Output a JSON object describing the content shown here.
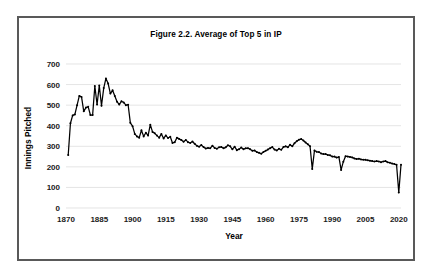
{
  "figure": {
    "title": "Figure 2.2. Average of Top 5 in IP",
    "border_color": "#595959",
    "background": "#ffffff"
  },
  "axis": {
    "x_label": "Year",
    "y_label": "Innings Pitched",
    "x_ticks": [
      "1870",
      "1885",
      "1900",
      "1915",
      "1930",
      "1945",
      "1960",
      "1975",
      "1990",
      "2005",
      "2020"
    ],
    "y_ticks": [
      "0",
      "100",
      "200",
      "300",
      "400",
      "500",
      "600",
      "700"
    ]
  },
  "chart_data": {
    "type": "line",
    "title": "Figure 2.2. Average of Top 5 in IP",
    "xlabel": "Year",
    "ylabel": "Innings Pitched",
    "xlim": [
      1870,
      2021
    ],
    "ylim": [
      0,
      700
    ],
    "grid": "horizontal",
    "legend": "none",
    "marker": "filled-circle",
    "line_color": "#000000",
    "x_tick_step": 15,
    "y_tick_step": 100,
    "annotations": [
      {
        "x": 1884,
        "y": 630,
        "note": "peak of series"
      },
      {
        "x": 1981,
        "y": 190,
        "note": "strike-shortened season"
      },
      {
        "x": 1994,
        "y": 185,
        "note": "strike-shortened season"
      },
      {
        "x": 2020,
        "y": 75,
        "note": "shortened season"
      }
    ],
    "x": [
      1871,
      1872,
      1873,
      1874,
      1875,
      1876,
      1877,
      1878,
      1879,
      1880,
      1881,
      1882,
      1883,
      1884,
      1885,
      1886,
      1887,
      1888,
      1889,
      1890,
      1891,
      1892,
      1893,
      1894,
      1895,
      1896,
      1897,
      1898,
      1899,
      1900,
      1901,
      1902,
      1903,
      1904,
      1905,
      1906,
      1907,
      1908,
      1909,
      1910,
      1911,
      1912,
      1913,
      1914,
      1915,
      1916,
      1917,
      1918,
      1919,
      1920,
      1921,
      1922,
      1923,
      1924,
      1925,
      1926,
      1927,
      1928,
      1929,
      1930,
      1931,
      1932,
      1933,
      1934,
      1935,
      1936,
      1937,
      1938,
      1939,
      1940,
      1941,
      1942,
      1943,
      1944,
      1945,
      1946,
      1947,
      1948,
      1949,
      1950,
      1951,
      1952,
      1953,
      1954,
      1955,
      1956,
      1957,
      1958,
      1959,
      1960,
      1961,
      1962,
      1963,
      1964,
      1965,
      1966,
      1967,
      1968,
      1969,
      1970,
      1971,
      1972,
      1973,
      1974,
      1975,
      1976,
      1977,
      1978,
      1979,
      1980,
      1981,
      1982,
      1983,
      1984,
      1985,
      1986,
      1987,
      1988,
      1989,
      1990,
      1991,
      1992,
      1993,
      1994,
      1995,
      1996,
      1997,
      1998,
      1999,
      2000,
      2001,
      2002,
      2003,
      2004,
      2005,
      2006,
      2007,
      2008,
      2009,
      2010,
      2011,
      2012,
      2013,
      2014,
      2015,
      2016,
      2017,
      2018,
      2019,
      2020,
      2021
    ],
    "y": [
      258,
      412,
      450,
      455,
      500,
      545,
      540,
      470,
      488,
      492,
      452,
      452,
      593,
      503,
      595,
      497,
      583,
      630,
      605,
      556,
      572,
      544,
      517,
      503,
      519,
      513,
      500,
      502,
      414,
      398,
      360,
      348,
      342,
      378,
      348,
      366,
      352,
      405,
      370,
      363,
      352,
      342,
      360,
      338,
      353,
      340,
      346,
      316,
      320,
      342,
      336,
      330,
      322,
      331,
      320,
      316,
      323,
      312,
      302,
      298,
      306,
      296,
      289,
      292,
      290,
      303,
      292,
      288,
      295,
      297,
      290,
      295,
      305,
      300,
      285,
      298,
      281,
      286,
      294,
      286,
      290,
      291,
      286,
      278,
      280,
      272,
      268,
      264,
      272,
      278,
      284,
      291,
      296,
      284,
      280,
      288,
      283,
      296,
      300,
      295,
      308,
      300,
      315,
      325,
      332,
      335,
      328,
      318,
      310,
      300,
      190,
      280,
      273,
      272,
      265,
      262,
      262,
      258,
      256,
      250,
      250,
      245,
      248,
      185,
      225,
      252,
      250,
      248,
      246,
      241,
      238,
      240,
      236,
      235,
      234,
      232,
      230,
      228,
      226,
      228,
      226,
      223,
      226,
      228,
      222,
      220,
      216,
      214,
      210,
      75,
      210
    ]
  }
}
